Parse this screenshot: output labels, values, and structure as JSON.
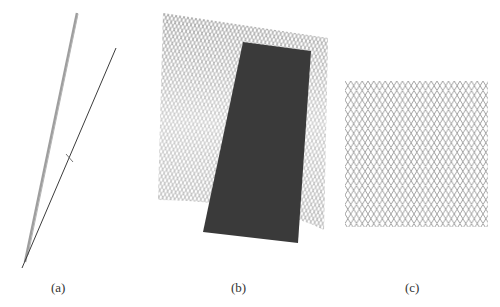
{
  "figure": {
    "panels": [
      {
        "id": "a",
        "label": "(a)",
        "description": "side view: two thin converging lines"
      },
      {
        "id": "b",
        "label": "(b)",
        "description": "tilted diamond mesh sheet with dark vertical band"
      },
      {
        "id": "c",
        "label": "(c)",
        "description": "regular diamond/hexagonal mesh pattern"
      }
    ],
    "colors": {
      "line_light": "#9a9a9a",
      "line_dark": "#444444",
      "mesh": "#8a8a8a",
      "band": "#3a3a3a"
    }
  }
}
